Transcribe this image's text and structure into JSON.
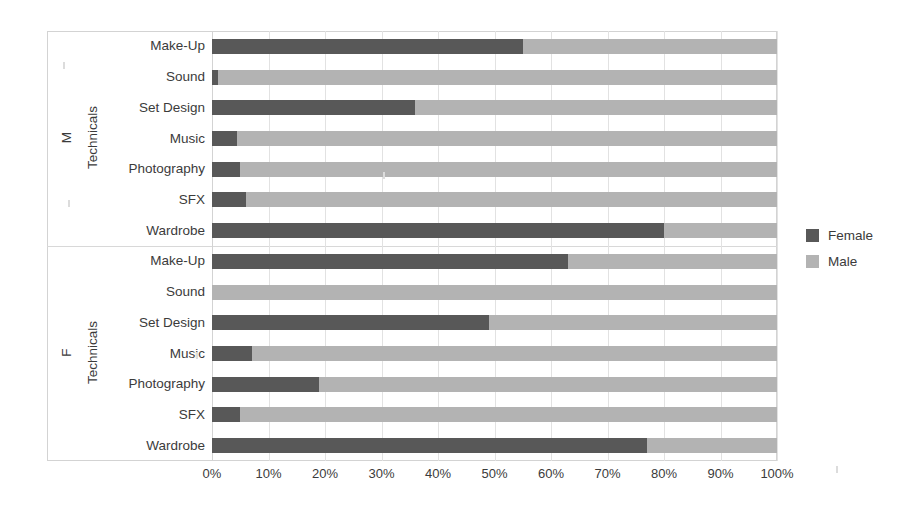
{
  "chart_data": {
    "type": "bar",
    "orientation": "horizontal",
    "stacked": true,
    "normalized_percent": true,
    "title": "",
    "xlabel": "",
    "ylabel": "Technicals",
    "xlim": [
      0,
      100
    ],
    "grid": true,
    "legend_position": "right",
    "legend": [
      "Female",
      "Male"
    ],
    "x_ticks": [
      "0%",
      "10%",
      "20%",
      "30%",
      "40%",
      "50%",
      "60%",
      "70%",
      "80%",
      "90%",
      "100%"
    ],
    "x_tick_values": [
      0,
      10,
      20,
      30,
      40,
      50,
      60,
      70,
      80,
      90,
      100
    ],
    "groups": [
      {
        "name": "M",
        "axis_label": "Technicals",
        "categories": [
          "Make-Up",
          "Sound",
          "Set Design",
          "Music",
          "Photography",
          "SFX",
          "Wardrobe"
        ],
        "series": [
          {
            "name": "Female",
            "color": "#585858",
            "values": [
              55,
              1,
              36,
              4.5,
              5,
              6,
              80
            ]
          },
          {
            "name": "Male",
            "color": "#b3b3b3",
            "values": [
              45,
              99,
              64,
              95.5,
              95,
              94,
              20
            ]
          }
        ]
      },
      {
        "name": "F",
        "axis_label": "Technicals",
        "categories": [
          "Make-Up",
          "Sound",
          "Set Design",
          "Music",
          "Photography",
          "SFX",
          "Wardrobe"
        ],
        "series": [
          {
            "name": "Female",
            "color": "#585858",
            "values": [
              63,
              0,
              49,
              7,
              19,
              5,
              77
            ]
          },
          {
            "name": "Male",
            "color": "#b3b3b3",
            "values": [
              37,
              100,
              51,
              93,
              81,
              95,
              23
            ]
          }
        ]
      }
    ]
  },
  "colors": {
    "female": "#585858",
    "male": "#b3b3b3",
    "gridline": "#e2e2e2",
    "frame": "#d3d3d3",
    "text": "#3b3b3b",
    "background": "#ffffff"
  },
  "legend": {
    "items": [
      {
        "label": "Female",
        "swatch": "#585858"
      },
      {
        "label": "Male",
        "swatch": "#b3b3b3"
      }
    ]
  },
  "axis": {
    "group_m": "M",
    "group_f": "F",
    "group_m_sub": "Technicals",
    "group_f_sub": "Technicals"
  }
}
